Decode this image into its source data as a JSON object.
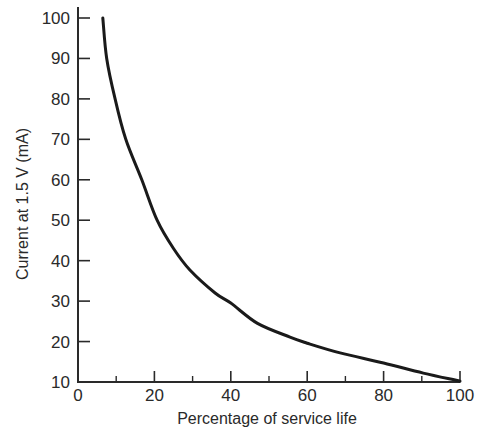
{
  "chart_data": {
    "type": "line",
    "title": "",
    "xlabel": "Percentage of service life",
    "ylabel": "Current at 1.5 V (mA)",
    "xlim": [
      0,
      100
    ],
    "ylim": [
      10,
      100
    ],
    "xticks_major": [
      0,
      20,
      40,
      60,
      80,
      100
    ],
    "xticks_minor": [
      10,
      30,
      50,
      70,
      90
    ],
    "yticks": [
      10,
      20,
      30,
      40,
      50,
      60,
      70,
      80,
      90,
      100
    ],
    "grid": false,
    "legend": null,
    "series": [
      {
        "name": "Current vs service life",
        "x": [
          6.5,
          7.5,
          9.7,
          12.5,
          16.7,
          20.7,
          25,
          29.3,
          35.9,
          40,
          47,
          55.5,
          60,
          68.6,
          80,
          90.4,
          100
        ],
        "y": [
          100,
          90,
          80,
          70,
          60,
          50,
          43,
          37.7,
          32,
          29.5,
          24.5,
          21.1,
          19.6,
          17.2,
          14.7,
          12.2,
          10.2
        ]
      }
    ]
  },
  "colors": {
    "line": "#1a1a1a",
    "axis": "#2a2a2a",
    "background": "#ffffff"
  }
}
